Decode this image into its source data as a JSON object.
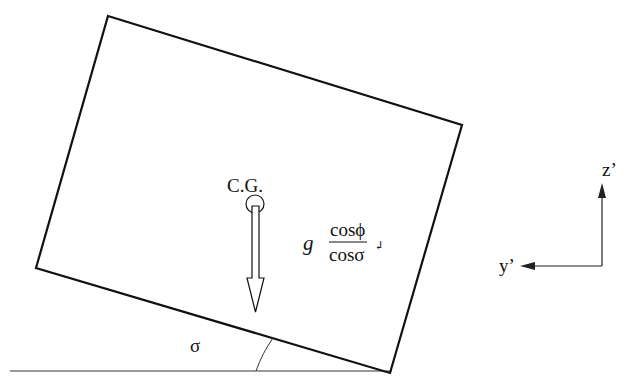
{
  "diagram": {
    "labels": {
      "cg": "C.G.",
      "g": "g",
      "numerator": "cosϕ",
      "denominator": "cosσ",
      "return_mark": "↲",
      "sigma": "σ",
      "z_axis": "z’",
      "y_axis": "y’"
    },
    "colors": {
      "stroke": "#111111",
      "background": "#ffffff"
    }
  }
}
